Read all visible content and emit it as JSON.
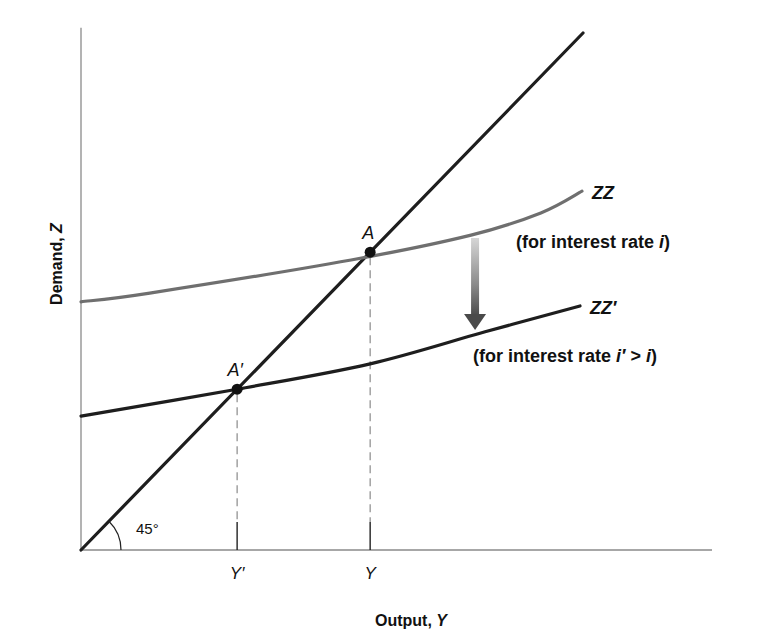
{
  "chart_data": {
    "type": "line",
    "title": "",
    "xlabel": "Output, ",
    "xlabel_var": "Y",
    "ylabel": "Demand, ",
    "ylabel_var": "Z",
    "xlim": [
      0,
      125.7
    ],
    "ylim": [
      0,
      101
    ],
    "grid": false,
    "legend": "none",
    "series": [
      {
        "name": "45-degree line",
        "color": "#1e1e1e",
        "points": [
          [
            0,
            0
          ],
          [
            100,
            100
          ]
        ]
      },
      {
        "name": "ZZ",
        "label": "ZZ",
        "sublabel": "(for interest rate ",
        "sublabel_var": "i",
        "sublabel_end": ")",
        "color": "#6f6f6f",
        "points": [
          [
            0,
            48.0
          ],
          [
            13.7,
            49.7
          ],
          [
            53.8,
            56.1
          ],
          [
            77.7,
            60.9
          ],
          [
            91.6,
            65.2
          ],
          [
            99.8,
            69.4
          ]
        ]
      },
      {
        "name": "ZZ'",
        "label": "ZZ′",
        "sublabel": "(for interest rate ",
        "sublabel_var": "i′",
        "sublabel_mid": " > ",
        "sublabel_var2": "i",
        "sublabel_end": ")",
        "color": "#1e1e1e",
        "points": [
          [
            0,
            25.9
          ],
          [
            31.1,
            31.1
          ],
          [
            57.6,
            36.0
          ],
          [
            80.5,
            42.2
          ],
          [
            99.4,
            47.2
          ]
        ]
      }
    ],
    "equilibria": [
      {
        "name": "A",
        "label": "A",
        "x": 57.6,
        "y": 57.6,
        "tick_label": "Y"
      },
      {
        "name": "A-prime",
        "label": "A′",
        "x": 31.1,
        "y": 31.1,
        "tick_label": "Y′"
      }
    ],
    "annotations": {
      "angle_label": "45°",
      "shift_arrow": {
        "direction": "down",
        "from": "ZZ",
        "to": "ZZ'",
        "x": 78.5
      }
    }
  }
}
